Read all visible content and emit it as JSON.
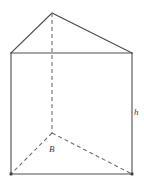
{
  "figure": {
    "name": "triangular-prism-diagram",
    "labels": {
      "height": "h",
      "base": "B"
    },
    "colors": {
      "solid_edge": "#4d4d4d",
      "dashed_edge": "#6e6e6e",
      "label_text": "#3d3d3d",
      "background": "#ffffff"
    },
    "vertices": {
      "apex_front": [
        52,
        13
      ],
      "top_left": [
        11,
        53
      ],
      "top_right": [
        132,
        53
      ],
      "bottom_left": [
        11,
        174
      ],
      "bottom_right": [
        132,
        174
      ],
      "back_bottom_hidden": [
        52,
        133
      ]
    },
    "edges": {
      "solid": [
        "apex_front-top_left",
        "apex_front-top_right",
        "top_left-top_right",
        "top_left-bottom_left",
        "top_right-bottom_right",
        "bottom_left-bottom_right"
      ],
      "dashed": [
        "apex_front-back_bottom_hidden",
        "back_bottom_hidden-bottom_left",
        "back_bottom_hidden-bottom_right"
      ]
    }
  }
}
